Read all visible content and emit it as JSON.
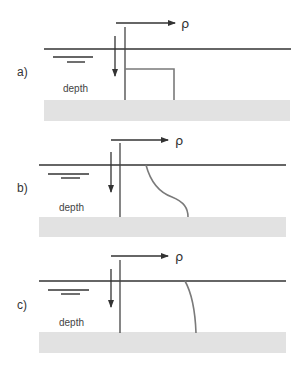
{
  "figure": {
    "colors": {
      "axis": "#333333",
      "profile": "#7a7a7a",
      "ground": "#e2e2e2",
      "background": "#ffffff"
    },
    "axis_labels": {
      "density": "ρ",
      "depth": "depth"
    },
    "panels": [
      {
        "id": "a",
        "label": "a)",
        "profile_type": "step",
        "density_symbol": "ρ",
        "depth_label": "depth"
      },
      {
        "id": "b",
        "label": "b)",
        "profile_type": "smooth-transition",
        "density_symbol": "ρ",
        "depth_label": "depth"
      },
      {
        "id": "c",
        "label": "c)",
        "profile_type": "gradual-increase",
        "density_symbol": "ρ",
        "depth_label": "depth"
      }
    ]
  }
}
